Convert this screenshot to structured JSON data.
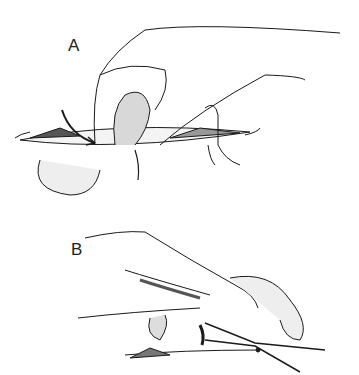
{
  "figure": {
    "panels": [
      {
        "label": "A",
        "description": "Hand inserted through incision, fingers encircling structure with curved needle/arrow"
      },
      {
        "label": "B",
        "description": "Hand retracting tissue while scissors dissect within incision"
      }
    ],
    "colors": {
      "line": "#1a1a1a",
      "background": "#ffffff",
      "shade": "#888888"
    }
  }
}
